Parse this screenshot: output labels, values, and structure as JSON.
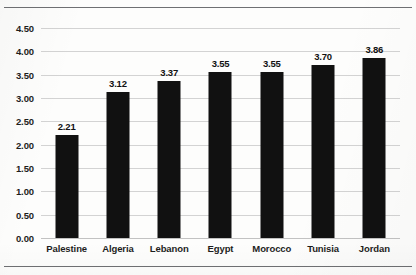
{
  "chart_data": {
    "type": "bar",
    "title": "",
    "subtitle": "",
    "xlabel": "",
    "ylabel": "",
    "categories": [
      "Palestine",
      "Algeria",
      "Lebanon",
      "Egypt",
      "Morocco",
      "Tunisia",
      "Jordan"
    ],
    "values": [
      2.21,
      3.12,
      3.37,
      3.55,
      3.55,
      3.7,
      3.86
    ],
    "value_labels": [
      "2.21",
      "3.12",
      "3.37",
      "3.55",
      "3.55",
      "3.70",
      "3.86"
    ],
    "ylim": [
      0.0,
      4.5
    ],
    "ytick_labels": [
      "0.00",
      "0.50",
      "1.00",
      "1.50",
      "2.00",
      "2.50",
      "3.00",
      "3.50",
      "4.00",
      "4.50"
    ],
    "ytick_values": [
      0.0,
      0.5,
      1.0,
      1.5,
      2.0,
      2.5,
      3.0,
      3.5,
      4.0,
      4.5
    ],
    "grid": true,
    "grid_axis": "y",
    "legend": false,
    "legend_position": "none",
    "series": [
      {
        "name": "",
        "values": [
          2.21,
          3.12,
          3.37,
          3.55,
          3.55,
          3.7,
          3.86
        ]
      }
    ],
    "colors": {
      "bar": "#111111",
      "gridline": "#d3d3d3",
      "text": "#1d1d1d",
      "background": "#fdfdfc",
      "page_rule": "#6f7073"
    }
  }
}
